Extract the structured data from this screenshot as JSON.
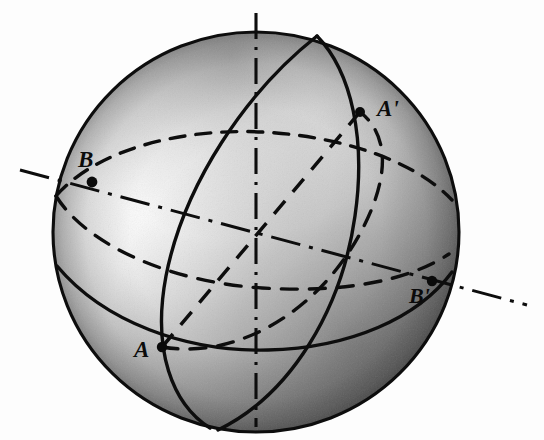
{
  "figure": {
    "kind": "geometry-diagram",
    "background_color": "#fdfdfd",
    "ink_color": "#101010",
    "sphere": {
      "center_x": 256,
      "center_y": 232,
      "radius_x": 203,
      "radius_y": 200,
      "outline_style": "solid",
      "shading": "radial-gradient, highlight upper-left, dark lower-right rim"
    },
    "labels": [
      {
        "id": "A",
        "text": "A",
        "x": 134,
        "y": 338,
        "point_x": 162,
        "point_y": 347
      },
      {
        "id": "Ap",
        "text": "A'",
        "x": 377,
        "y": 97,
        "point_x": 360,
        "point_y": 112
      },
      {
        "id": "B",
        "text": "B",
        "x": 78,
        "y": 148,
        "point_x": 92,
        "point_y": 182
      },
      {
        "id": "Bp",
        "text": "B'",
        "x": 409,
        "y": 285,
        "point_x": 432,
        "point_y": 281
      }
    ],
    "axes": [
      {
        "id": "polar-axis",
        "style": "dash-dot",
        "x1": 256,
        "y1": 13,
        "x2": 256,
        "y2": 427,
        "description": "vertical polar axis of the sphere"
      },
      {
        "id": "axis-BB-prime",
        "style": "dash-dot",
        "x1": 20,
        "y1": 170,
        "x2": 527,
        "y2": 305,
        "description": "straight axis through B and B-prime"
      },
      {
        "id": "axis-AA-prime",
        "style": "dashed",
        "x1": 162,
        "y1": 347,
        "x2": 360,
        "y2": 112,
        "description": "straight chord through A and A-prime passing through center"
      }
    ],
    "circles": [
      {
        "id": "outline",
        "style": "solid",
        "description": "sphere silhouette"
      },
      {
        "id": "meridian-front",
        "style": "solid",
        "description": "front meridian great circle, tilted"
      },
      {
        "id": "equator-front",
        "style": "solid",
        "description": "lower horizontal great circle, front arc"
      },
      {
        "id": "equator-back",
        "style": "dashed",
        "description": "horizontal great circle through B, rear arc"
      },
      {
        "id": "great-circle-AA",
        "style": "dashed",
        "description": "great circle through A and A-prime"
      }
    ]
  }
}
